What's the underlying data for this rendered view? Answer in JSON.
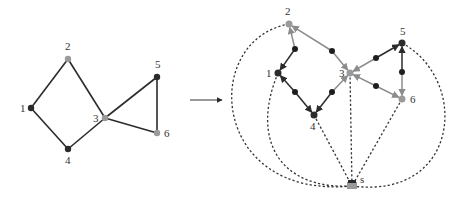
{
  "colors": {
    "dark_node": "#2b2b2b",
    "light_node": "#9a9a9a",
    "dark_edge": "#2b2b2b",
    "light_edge": "#8c8c8c",
    "dashed": "#333333"
  },
  "left_graph": {
    "nodes": [
      {
        "id": "1",
        "label": "1",
        "x": 31,
        "y": 108,
        "shade": "dark",
        "lx": 20,
        "ly": 112
      },
      {
        "id": "2",
        "label": "2",
        "x": 68,
        "y": 59,
        "shade": "light",
        "lx": 65,
        "ly": 50
      },
      {
        "id": "3",
        "label": "3",
        "x": 105,
        "y": 118,
        "shade": "light",
        "lx": 93,
        "ly": 122
      },
      {
        "id": "4",
        "label": "4",
        "x": 68,
        "y": 149,
        "shade": "dark",
        "lx": 65,
        "ly": 164
      },
      {
        "id": "5",
        "label": "5",
        "x": 157,
        "y": 77,
        "shade": "dark",
        "lx": 155,
        "ly": 68
      },
      {
        "id": "6",
        "label": "6",
        "x": 157,
        "y": 133,
        "shade": "light",
        "lx": 164,
        "ly": 137
      }
    ],
    "edges": [
      [
        "1",
        "2"
      ],
      [
        "2",
        "3"
      ],
      [
        "3",
        "4"
      ],
      [
        "4",
        "1"
      ],
      [
        "3",
        "5"
      ],
      [
        "5",
        "6"
      ],
      [
        "6",
        "3"
      ]
    ]
  },
  "arrow": {
    "x1": 190,
    "y1": 100,
    "x2": 222,
    "y2": 100
  },
  "right_graph": {
    "nodes": [
      {
        "id": "1",
        "label": "1",
        "x": 278,
        "y": 73,
        "shade": "dark",
        "lx": 266,
        "ly": 77
      },
      {
        "id": "2",
        "label": "2",
        "x": 289,
        "y": 24,
        "shade": "light",
        "lx": 285,
        "ly": 15
      },
      {
        "id": "3",
        "label": "3",
        "x": 350,
        "y": 73,
        "shade": "light",
        "lx": 339,
        "ly": 77
      },
      {
        "id": "4",
        "label": "4",
        "x": 314,
        "y": 115,
        "shade": "dark",
        "lx": 310,
        "ly": 130
      },
      {
        "id": "5",
        "label": "5",
        "x": 402,
        "y": 43,
        "shade": "dark",
        "lx": 400,
        "ly": 35
      },
      {
        "id": "6",
        "label": "6",
        "x": 402,
        "y": 99,
        "shade": "light",
        "lx": 410,
        "ly": 103
      },
      {
        "id": "s",
        "label": "s",
        "x": 352,
        "y": 186,
        "shade": "light",
        "lx": 360,
        "ly": 183
      }
    ],
    "arcs": [
      {
        "from": "2",
        "to": "1",
        "mid": [
          295,
          49
        ],
        "color_from": "light",
        "color_to": "dark"
      },
      {
        "from": "2",
        "to": "3",
        "mid": [
          332,
          51
        ],
        "color_from": "light",
        "color_to": "light"
      },
      {
        "from": "4",
        "to": "1",
        "mid": [
          295,
          92
        ],
        "color_from": "dark",
        "color_to": "dark"
      },
      {
        "from": "4",
        "to": "3",
        "mid": [
          332,
          92
        ],
        "color_from": "dark",
        "color_to": "light"
      },
      {
        "from": "5",
        "to": "3",
        "mid": [
          376,
          58
        ],
        "color_from": "dark",
        "color_to": "light"
      },
      {
        "from": "5",
        "to": "6",
        "mid": [
          402,
          72
        ],
        "color_from": "dark",
        "color_to": "light"
      },
      {
        "from": "6",
        "to": "3",
        "mid": [
          376,
          86
        ],
        "color_from": "light",
        "color_to": "light"
      }
    ],
    "dashed_links": [
      {
        "to": "2",
        "path": "M289,24 C 200,40 210,200 352,186"
      },
      {
        "to": "1",
        "path": "M278,73 C 250,140 280,190 352,186"
      },
      {
        "to": "4",
        "path": "M314,115 L352,186"
      },
      {
        "to": "3",
        "path": "M350,73 L352,186"
      },
      {
        "to": "6",
        "path": "M402,99 L352,186"
      },
      {
        "to": "5",
        "path": "M402,43 C 470,80 460,200 352,186"
      }
    ]
  }
}
